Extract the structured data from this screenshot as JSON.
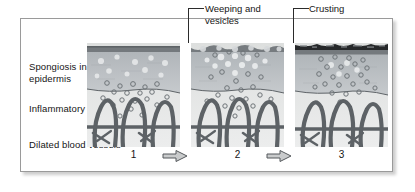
{
  "figure": {
    "kind": "eczema-progression-histology-diagram",
    "row_labels": [
      {
        "name": "spongiosis",
        "text": "Spongiosis in epidermis"
      },
      {
        "name": "inflammatory-cells",
        "text": "Inflammatory cells"
      },
      {
        "name": "dilated-blood-vessels",
        "text": "Dilated blood vessels"
      }
    ],
    "callouts": [
      {
        "name": "weeping-and-vesicles",
        "text": "Weeping and vesicles",
        "target_panel": "2"
      },
      {
        "name": "crusting",
        "text": "Crusting",
        "target_panel": "3"
      }
    ],
    "panels": [
      {
        "number": "1",
        "surface": "smooth",
        "feature": "spongiosis with scattered inflammatory cells"
      },
      {
        "number": "2",
        "surface": "bumpy-vesicular",
        "feature": "weeping and vesicles at the surface"
      },
      {
        "number": "3",
        "surface": "dark-crust",
        "feature": "crusting over the epidermis"
      }
    ],
    "arrows": [
      {
        "name": "progression-arrow-1-to-2",
        "glyph": "right-arrow-icon"
      },
      {
        "name": "progression-arrow-2-to-3",
        "glyph": "right-arrow-icon"
      }
    ],
    "colors": {
      "surface_line": "#6b6f73",
      "crust": "#2c2c2c",
      "epidermis": "#b9bec2",
      "dermis": "#dcdedd",
      "vessel": "#5d6266",
      "cell_outline": "#6e7478",
      "frame_border": "#9a9a9a",
      "leader_line": "#2b2b2b",
      "text": "#151515"
    }
  }
}
